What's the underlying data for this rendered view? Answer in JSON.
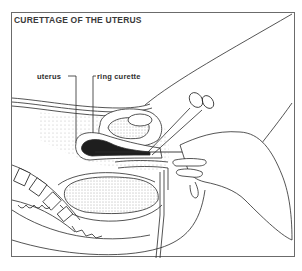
{
  "figure": {
    "title": "CURETTAGE OF THE UTERUS",
    "labels": [
      {
        "id": "uterus",
        "text": "uterus"
      },
      {
        "id": "ring-curette",
        "text": "ring curette"
      }
    ],
    "colors": {
      "line": "#2a2a2a",
      "shade": "#8a8a8a",
      "frame": "#6b6b6b",
      "background": "#ffffff"
    }
  }
}
